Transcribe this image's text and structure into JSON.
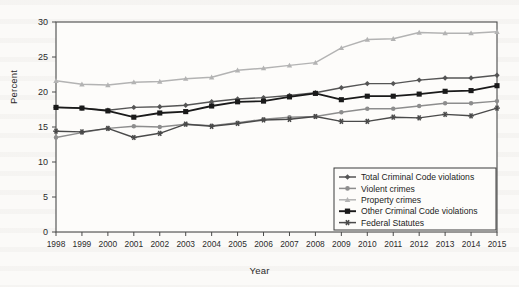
{
  "chart_data": {
    "type": "line",
    "title": "",
    "xlabel": "Year",
    "ylabel": "Percent",
    "categories": [
      1998,
      1999,
      2000,
      2001,
      2002,
      2003,
      2004,
      2005,
      2006,
      2007,
      2008,
      2009,
      2010,
      2011,
      2012,
      2013,
      2014,
      2015
    ],
    "xlim": [
      1998,
      2015
    ],
    "ylim": [
      0,
      30
    ],
    "yticks": [
      0,
      5,
      10,
      15,
      20,
      25,
      30
    ],
    "xticks": [
      "1998",
      "1999",
      "2000",
      "2001",
      "2002",
      "2003",
      "2004",
      "2005",
      "2006",
      "2007",
      "2008",
      "2009",
      "2010",
      "2011",
      "2012",
      "2013",
      "2014",
      "2015"
    ],
    "grid": false,
    "legend_position": "inside-bottom-right",
    "series": [
      {
        "name": "Total Criminal Code violations",
        "marker": "diamond",
        "color": "#555555",
        "values": [
          17.8,
          17.7,
          17.4,
          17.8,
          17.9,
          18.1,
          18.6,
          19.0,
          19.2,
          19.5,
          19.9,
          20.6,
          21.2,
          21.2,
          21.7,
          22.0,
          22.0,
          22.4
        ]
      },
      {
        "name": "Violent crimes",
        "marker": "circle",
        "color": "#8d8d8d",
        "values": [
          13.5,
          14.2,
          14.8,
          15.1,
          15.0,
          15.4,
          15.2,
          15.6,
          16.1,
          16.4,
          16.5,
          17.1,
          17.6,
          17.6,
          18.0,
          18.4,
          18.4,
          18.7
        ]
      },
      {
        "name": "Property crimes",
        "marker": "triangle",
        "color": "#b3b3b3",
        "values": [
          21.6,
          21.1,
          21.0,
          21.4,
          21.5,
          21.9,
          22.1,
          23.1,
          23.4,
          23.8,
          24.2,
          26.3,
          27.5,
          27.6,
          28.5,
          28.4,
          28.4,
          28.6
        ]
      },
      {
        "name": "Other Criminal Code violations",
        "marker": "square",
        "color": "#1a1a1a",
        "values": [
          17.8,
          17.7,
          17.3,
          16.4,
          17.0,
          17.2,
          18.0,
          18.6,
          18.7,
          19.3,
          19.8,
          18.9,
          19.4,
          19.4,
          19.7,
          20.1,
          20.2,
          20.9
        ]
      },
      {
        "name": "Federal Statutes",
        "marker": "asterisk",
        "color": "#4a4a4a",
        "values": [
          14.4,
          14.3,
          14.8,
          13.5,
          14.1,
          15.4,
          15.1,
          15.5,
          16.0,
          16.1,
          16.5,
          15.8,
          15.8,
          16.4,
          16.3,
          16.8,
          16.6,
          17.7
        ]
      }
    ]
  },
  "legend": {
    "items": [
      {
        "label": "Total Criminal Code violations"
      },
      {
        "label": "Violent crimes"
      },
      {
        "label": "Property crimes"
      },
      {
        "label": "Other Criminal Code violations"
      },
      {
        "label": "Federal Statutes"
      }
    ]
  },
  "axes": {
    "y_title": "Percent",
    "x_title": "Year"
  }
}
